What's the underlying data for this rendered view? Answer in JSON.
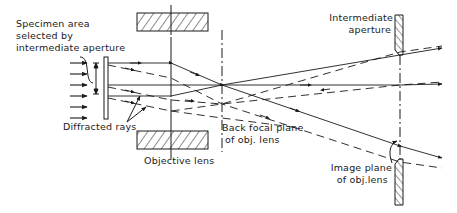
{
  "diagram": {
    "type": "ray-diagram",
    "colors": {
      "ink": "#1a1a1a",
      "background": "#ffffff"
    },
    "labels": {
      "specimen_line1": "Specimen area",
      "specimen_line2": "selected by",
      "specimen_line3": "intermediate aperture",
      "diffracted_rays": "Diffracted rays",
      "objective_lens": "Objective lens",
      "back_focal_line1": "Back focal plane",
      "back_focal_line2": "of obj. lens",
      "intermediate_line1": "Intermediate",
      "intermediate_line2": "aperture",
      "image_plane_line1": "Image plane",
      "image_plane_line2": "of obj.lens"
    },
    "components": [
      {
        "name": "incident-beam",
        "count": 7
      },
      {
        "name": "specimen"
      },
      {
        "name": "objective-lens",
        "style": "hatched pole pieces"
      },
      {
        "name": "back-focal-plane",
        "style": "dash-dot line"
      },
      {
        "name": "image-plane",
        "style": "dash-dot line"
      },
      {
        "name": "intermediate-aperture",
        "style": "hatched blades"
      }
    ],
    "ray_types": [
      "direct (solid)",
      "diffracted (dashed)"
    ]
  }
}
